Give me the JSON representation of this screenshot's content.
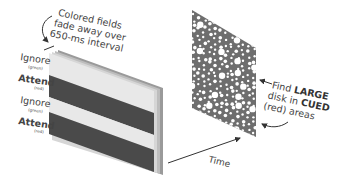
{
  "annotation_top": {
    "lines": [
      "Colored fields",
      "fade away over",
      "650-ms interval"
    ]
  },
  "stripe_labels": [
    {
      "main": "Ignore",
      "sub": "(green)"
    },
    {
      "main": "Attend",
      "sub": "(red)"
    },
    {
      "main": "Ignore",
      "sub": "(green)"
    },
    {
      "main": "Attend",
      "sub": "(red)"
    }
  ],
  "annotation_right": {
    "line1_pre": "Find ",
    "line1_emph": "LARGE",
    "line2_pre": "disk in ",
    "line2_emph": "CUED",
    "line3": "(red) areas"
  },
  "time_label": "Time",
  "colors": {
    "light_stripe": "#e6e6e6",
    "dark_stripe": "#4a4a4a",
    "dot_field": "#6e6e6e",
    "dot": "#ffffff",
    "text": "#444444",
    "arrow": "#333333"
  }
}
